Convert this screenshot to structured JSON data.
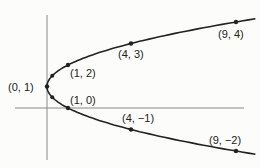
{
  "diagram": {
    "type": "parabola",
    "equation_implied": "x = (y - 1)^2",
    "axes": {
      "x_axis": true,
      "y_axis": true
    },
    "points": [
      {
        "label": "(0, 1)",
        "x": 0,
        "y": 1
      },
      {
        "label": "(1, 2)",
        "x": 1,
        "y": 2
      },
      {
        "label": "(1, 0)",
        "x": 1,
        "y": 0
      },
      {
        "label": "(4, 3)",
        "x": 4,
        "y": 3
      },
      {
        "label": "(4, −1)",
        "x": 4,
        "y": -1
      },
      {
        "label": "(9, 4)",
        "x": 9,
        "y": 4
      },
      {
        "label": "(9, −2)",
        "x": 9,
        "y": -2
      }
    ]
  }
}
